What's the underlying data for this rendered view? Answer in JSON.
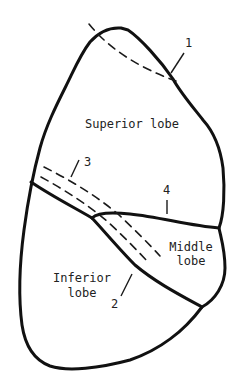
{
  "diagram": {
    "type": "lung lobes outline drawing",
    "colors": {
      "stroke": "#111111",
      "background": "#ffffff",
      "text": "#222222"
    },
    "lobes": [
      {
        "id": "superior",
        "label": "Superior lobe"
      },
      {
        "id": "middle",
        "label_line1": "Middle",
        "label_line2": "lobe"
      },
      {
        "id": "inferior",
        "label_line1": "Inferior",
        "label_line2": "lobe"
      }
    ],
    "callouts": [
      {
        "id": "1",
        "text": "1"
      },
      {
        "id": "2",
        "text": "2"
      },
      {
        "id": "3",
        "text": "3"
      },
      {
        "id": "4",
        "text": "4"
      }
    ]
  }
}
